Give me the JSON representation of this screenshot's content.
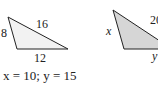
{
  "figure": {
    "triangle_a": {
      "side_left": "8",
      "side_top": "16",
      "side_bottom": "12",
      "fill": "#f2f2f2"
    },
    "triangle_b": {
      "side_left": "x",
      "side_top": "20",
      "side_bottom": "y",
      "fill": "#d6d6d6"
    },
    "answer": "x = 10; y = 15"
  }
}
